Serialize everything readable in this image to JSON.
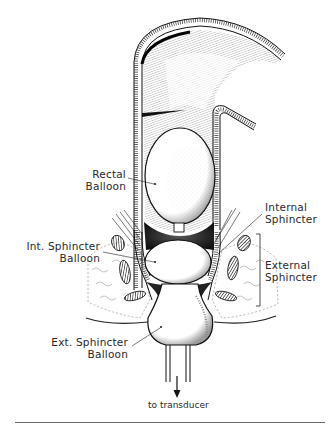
{
  "figure": {
    "type": "anatomical-diagram"
  },
  "labels": {
    "rectal_balloon": {
      "line1": "Rectal",
      "line2": "Balloon"
    },
    "internal_sphincter": {
      "line1": "Internal",
      "line2": "Sphincter"
    },
    "int_sphincter_balloon": {
      "line1": "Int. Sphincter",
      "line2": "Balloon"
    },
    "external_sphincter": {
      "line1": "External",
      "line2": "Sphincter"
    },
    "ext_sphincter_balloon": {
      "line1": "Ext. Sphincter",
      "line2": "Balloon"
    },
    "transducer": "to transducer"
  },
  "colors": {
    "ink": "#1a1a1a",
    "background": "#ffffff",
    "rule": "#6a6a6a"
  }
}
